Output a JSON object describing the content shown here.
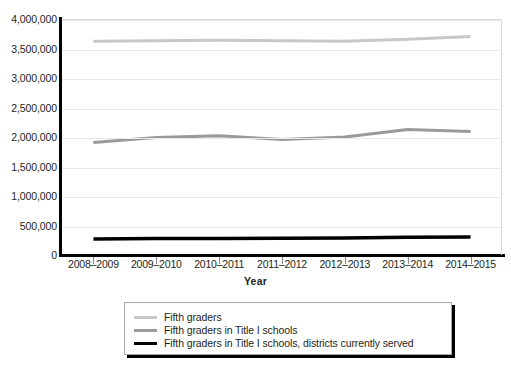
{
  "chart_data": {
    "type": "line",
    "title": "",
    "xlabel": "Year",
    "ylabel": "",
    "categories": [
      "2008–2009",
      "2009–2010",
      "2010–2011",
      "2011–2012",
      "2012–2013",
      "2013–2014",
      "2014–2015"
    ],
    "ylim": [
      0,
      4000000
    ],
    "yticks": [
      0,
      500000,
      1000000,
      1500000,
      2000000,
      2500000,
      3000000,
      3500000,
      4000000
    ],
    "ytick_labels": [
      "0",
      "500,000",
      "1,000,000",
      "1,500,000",
      "2,000,000",
      "2,500,000",
      "3,000,000",
      "3,500,000",
      "4,000,000"
    ],
    "grid": true,
    "grid_axis": "y",
    "legend_position": "below",
    "series": [
      {
        "name": "Fifth graders",
        "color": "#c8c8c8",
        "width": 3,
        "values": [
          3640000,
          3650000,
          3655000,
          3650000,
          3640000,
          3675000,
          3720000
        ]
      },
      {
        "name": "Fifth graders in Title I schools",
        "color": "#9a9a9a",
        "width": 3,
        "values": [
          1925000,
          2010000,
          2040000,
          1975000,
          2015000,
          2145000,
          2110000
        ]
      },
      {
        "name": "Fifth graders in Title I schools, districts currently served",
        "color": "#000000",
        "width": 3.5,
        "values": [
          290000,
          295000,
          298000,
          300000,
          303000,
          318000,
          320000
        ]
      }
    ]
  },
  "legend": {
    "items": [
      {
        "label": "Fifth graders"
      },
      {
        "label": "Fifth graders in Title I schools"
      },
      {
        "label": "Fifth graders in Title I schools, districts currently served"
      }
    ]
  }
}
